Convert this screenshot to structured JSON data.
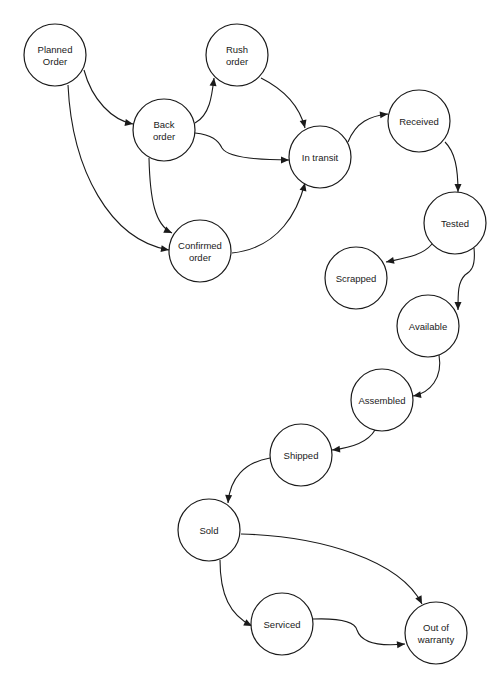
{
  "diagram": {
    "type": "state-transition",
    "nodes": [
      {
        "id": "planned",
        "label": [
          "Planned",
          "Order"
        ]
      },
      {
        "id": "rush",
        "label": [
          "Rush",
          "order"
        ]
      },
      {
        "id": "back",
        "label": [
          "Back",
          "order"
        ]
      },
      {
        "id": "transit",
        "label": [
          "In transit"
        ]
      },
      {
        "id": "received",
        "label": [
          "Received"
        ]
      },
      {
        "id": "confirmed",
        "label": [
          "Confirmed",
          "order"
        ]
      },
      {
        "id": "tested",
        "label": [
          "Tested"
        ]
      },
      {
        "id": "scrapped",
        "label": [
          "Scrapped"
        ]
      },
      {
        "id": "available",
        "label": [
          "Available"
        ]
      },
      {
        "id": "assembled",
        "label": [
          "Assembled"
        ]
      },
      {
        "id": "shipped",
        "label": [
          "Shipped"
        ]
      },
      {
        "id": "sold",
        "label": [
          "Sold"
        ]
      },
      {
        "id": "serviced",
        "label": [
          "Serviced"
        ]
      },
      {
        "id": "warranty",
        "label": [
          "Out of",
          "warranty"
        ]
      }
    ],
    "edges": [
      {
        "from": "planned",
        "to": "back"
      },
      {
        "from": "planned",
        "to": "confirmed"
      },
      {
        "from": "back",
        "to": "rush"
      },
      {
        "from": "back",
        "to": "transit"
      },
      {
        "from": "back",
        "to": "confirmed"
      },
      {
        "from": "rush",
        "to": "transit"
      },
      {
        "from": "confirmed",
        "to": "transit"
      },
      {
        "from": "transit",
        "to": "received"
      },
      {
        "from": "received",
        "to": "tested"
      },
      {
        "from": "tested",
        "to": "scrapped"
      },
      {
        "from": "tested",
        "to": "available"
      },
      {
        "from": "available",
        "to": "assembled"
      },
      {
        "from": "assembled",
        "to": "shipped"
      },
      {
        "from": "shipped",
        "to": "sold"
      },
      {
        "from": "sold",
        "to": "serviced"
      },
      {
        "from": "sold",
        "to": "warranty"
      },
      {
        "from": "serviced",
        "to": "warranty"
      }
    ]
  }
}
